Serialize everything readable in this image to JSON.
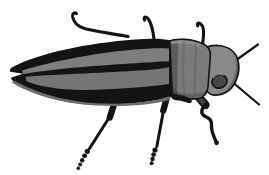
{
  "figure": {
    "colors": {
      "background": "#ffffff",
      "ink": "#141414",
      "stripe_gray_upper": "#7e7e7e",
      "stripe_gray_lower": "#757575",
      "rim_gray": "#6d6d6d",
      "pronotum_gray": "#7b7b7b",
      "head_gray": "#8a8a8a",
      "eye_gray": "#474747",
      "femur_gray": "#3f3f3f",
      "notch_white": "#ffffff"
    }
  }
}
